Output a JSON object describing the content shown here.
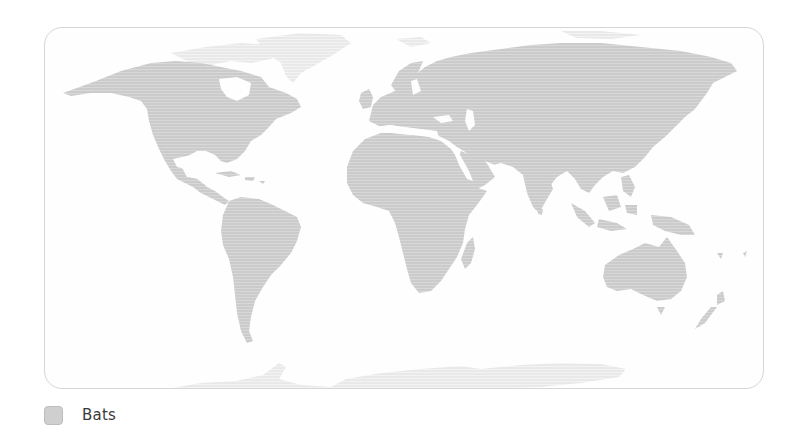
{
  "map": {
    "title": "Bats distribution world map",
    "colors": {
      "range_fill": "#c9c9c9",
      "range_stripe": "#d9d9d9",
      "no_range_fill": "#ececec",
      "background": "#fefefe",
      "frame_border": "#d6d6d6"
    },
    "regions_with_range": [
      "North America",
      "Central America",
      "South America",
      "Europe",
      "Africa",
      "Asia",
      "Oceania"
    ],
    "regions_without_range": [
      "Greenland",
      "Arctic islands",
      "Antarctica"
    ]
  },
  "legend": {
    "items": [
      {
        "label": "Bats",
        "swatch_color": "#cfcfcf"
      }
    ]
  }
}
